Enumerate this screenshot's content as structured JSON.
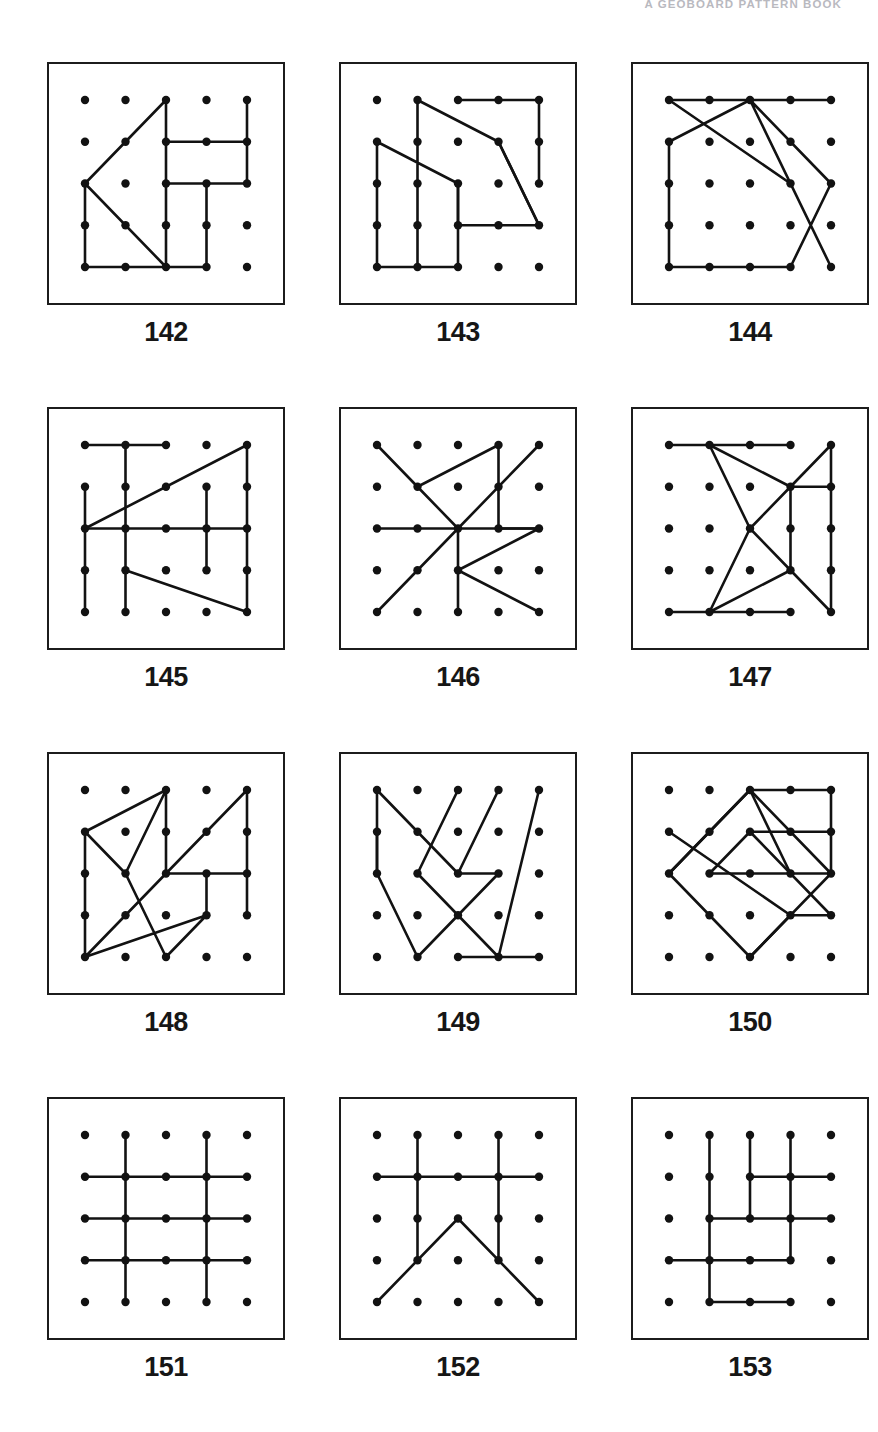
{
  "header": {
    "running_head": "A GEOBOARD PATTERN BOOK"
  },
  "geoboard": {
    "grid_size": 5,
    "dot_color": "#121212",
    "line_color": "#121212",
    "frame_color": "#1c1c1c",
    "background": "#ffffff"
  },
  "plates": [
    {
      "caption": "142",
      "paths": [
        [
          [
            2,
            0
          ],
          [
            0,
            2
          ],
          [
            2,
            4
          ],
          [
            2,
            0
          ]
        ],
        [
          [
            2,
            1
          ],
          [
            4,
            1
          ],
          [
            4,
            0
          ]
        ],
        [
          [
            2,
            2
          ],
          [
            4,
            2
          ],
          [
            4,
            1
          ]
        ],
        [
          [
            0,
            2
          ],
          [
            0,
            4
          ],
          [
            3,
            4
          ],
          [
            3,
            2
          ]
        ]
      ]
    },
    {
      "caption": "143",
      "paths": [
        [
          [
            1,
            0
          ],
          [
            1,
            4
          ],
          [
            2,
            4
          ],
          [
            2,
            2
          ],
          [
            0,
            1
          ],
          [
            0,
            4
          ],
          [
            1,
            4
          ]
        ],
        [
          [
            1,
            0
          ],
          [
            3,
            1
          ],
          [
            4,
            3
          ],
          [
            2,
            3
          ],
          [
            2,
            2
          ]
        ],
        [
          [
            2,
            0
          ],
          [
            4,
            0
          ],
          [
            4,
            2
          ]
        ],
        [
          [
            3,
            1
          ],
          [
            4,
            3
          ]
        ]
      ]
    },
    {
      "caption": "144",
      "paths": [
        [
          [
            0,
            0
          ],
          [
            4,
            0
          ]
        ],
        [
          [
            0,
            0
          ],
          [
            3,
            2
          ],
          [
            4,
            4
          ],
          [
            2,
            0
          ],
          [
            0,
            1
          ],
          [
            0,
            4
          ],
          [
            3,
            4
          ],
          [
            4,
            2
          ],
          [
            2,
            0
          ]
        ]
      ]
    },
    {
      "caption": "145",
      "paths": [
        [
          [
            0,
            0
          ],
          [
            2,
            0
          ]
        ],
        [
          [
            1,
            0
          ],
          [
            1,
            4
          ]
        ],
        [
          [
            0,
            1
          ],
          [
            0,
            4
          ]
        ],
        [
          [
            4,
            0
          ],
          [
            4,
            4
          ]
        ],
        [
          [
            3,
            1
          ],
          [
            3,
            3
          ]
        ],
        [
          [
            0,
            2
          ],
          [
            4,
            2
          ]
        ],
        [
          [
            4,
            0
          ],
          [
            0,
            2
          ]
        ],
        [
          [
            1,
            3
          ],
          [
            4,
            4
          ]
        ]
      ]
    },
    {
      "caption": "146",
      "paths": [
        [
          [
            0,
            0
          ],
          [
            1,
            1
          ],
          [
            3,
            0
          ],
          [
            3,
            2
          ],
          [
            4,
            2
          ]
        ],
        [
          [
            4,
            0
          ],
          [
            2,
            2
          ],
          [
            0,
            4
          ]
        ],
        [
          [
            1,
            1
          ],
          [
            2,
            2
          ],
          [
            4,
            2
          ],
          [
            2,
            3
          ],
          [
            4,
            4
          ]
        ],
        [
          [
            0,
            2
          ],
          [
            2,
            2
          ]
        ],
        [
          [
            2,
            2
          ],
          [
            2,
            4
          ]
        ]
      ]
    },
    {
      "caption": "147",
      "paths": [
        [
          [
            0,
            0
          ],
          [
            3,
            0
          ]
        ],
        [
          [
            1,
            0
          ],
          [
            3,
            1
          ],
          [
            4,
            0
          ],
          [
            4,
            4
          ],
          [
            3,
            3
          ],
          [
            1,
            4
          ],
          [
            0,
            4
          ],
          [
            3,
            4
          ]
        ],
        [
          [
            1,
            0
          ],
          [
            2,
            2
          ],
          [
            3,
            1
          ],
          [
            4,
            1
          ]
        ],
        [
          [
            2,
            2
          ],
          [
            3,
            3
          ]
        ],
        [
          [
            3,
            1
          ],
          [
            3,
            3
          ]
        ],
        [
          [
            1,
            4
          ],
          [
            2,
            2
          ]
        ]
      ]
    },
    {
      "caption": "148",
      "paths": [
        [
          [
            2,
            0
          ],
          [
            0,
            1
          ],
          [
            1,
            2
          ],
          [
            2,
            0
          ],
          [
            2,
            2
          ],
          [
            0,
            4
          ],
          [
            3,
            3
          ],
          [
            2,
            4
          ],
          [
            1,
            2
          ]
        ],
        [
          [
            2,
            2
          ],
          [
            4,
            0
          ],
          [
            4,
            2
          ],
          [
            2,
            2
          ]
        ],
        [
          [
            0,
            1
          ],
          [
            0,
            4
          ]
        ],
        [
          [
            3,
            2
          ],
          [
            3,
            3
          ]
        ],
        [
          [
            4,
            2
          ],
          [
            4,
            3
          ]
        ]
      ]
    },
    {
      "caption": "149",
      "paths": [
        [
          [
            0,
            0
          ],
          [
            2,
            2
          ],
          [
            3,
            0
          ]
        ],
        [
          [
            0,
            0
          ],
          [
            0,
            2
          ],
          [
            1,
            4
          ],
          [
            3,
            2
          ],
          [
            2,
            2
          ]
        ],
        [
          [
            0,
            1
          ],
          [
            0,
            2
          ]
        ],
        [
          [
            2,
            0
          ],
          [
            1,
            2
          ]
        ],
        [
          [
            1,
            2
          ],
          [
            3,
            4
          ]
        ],
        [
          [
            4,
            0
          ],
          [
            3,
            4
          ]
        ],
        [
          [
            2,
            4
          ],
          [
            4,
            4
          ]
        ]
      ]
    },
    {
      "caption": "150",
      "paths": [
        [
          [
            2,
            0
          ],
          [
            4,
            2
          ],
          [
            2,
            4
          ],
          [
            0,
            2
          ],
          [
            2,
            0
          ]
        ],
        [
          [
            0,
            1
          ],
          [
            3,
            3
          ],
          [
            4,
            3
          ],
          [
            2,
            1
          ],
          [
            1,
            2
          ]
        ],
        [
          [
            1,
            2
          ],
          [
            3,
            2
          ],
          [
            4,
            2
          ]
        ],
        [
          [
            2,
            0
          ],
          [
            3,
            2
          ]
        ],
        [
          [
            2,
            0
          ],
          [
            0,
            2
          ]
        ],
        [
          [
            2,
            1
          ],
          [
            4,
            1
          ],
          [
            4,
            0
          ],
          [
            2,
            0
          ]
        ],
        [
          [
            4,
            1
          ],
          [
            4,
            2
          ]
        ],
        [
          [
            3,
            3
          ],
          [
            2,
            4
          ]
        ]
      ]
    },
    {
      "caption": "151",
      "paths": [
        [
          [
            1,
            0
          ],
          [
            1,
            4
          ]
        ],
        [
          [
            3,
            0
          ],
          [
            3,
            4
          ]
        ],
        [
          [
            0,
            1
          ],
          [
            4,
            1
          ]
        ],
        [
          [
            0,
            2
          ],
          [
            4,
            2
          ]
        ],
        [
          [
            0,
            3
          ],
          [
            4,
            3
          ]
        ]
      ]
    },
    {
      "caption": "152",
      "paths": [
        [
          [
            1,
            0
          ],
          [
            1,
            3
          ]
        ],
        [
          [
            3,
            0
          ],
          [
            3,
            3
          ]
        ],
        [
          [
            0,
            1
          ],
          [
            4,
            1
          ]
        ],
        [
          [
            0,
            4
          ],
          [
            2,
            2
          ],
          [
            4,
            4
          ]
        ]
      ]
    },
    {
      "caption": "153",
      "paths": [
        [
          [
            1,
            0
          ],
          [
            1,
            4
          ]
        ],
        [
          [
            2,
            0
          ],
          [
            2,
            2
          ]
        ],
        [
          [
            3,
            0
          ],
          [
            3,
            2
          ]
        ],
        [
          [
            2,
            1
          ],
          [
            4,
            1
          ]
        ],
        [
          [
            1,
            2
          ],
          [
            4,
            2
          ]
        ],
        [
          [
            3,
            2
          ],
          [
            3,
            3
          ]
        ],
        [
          [
            0,
            3
          ],
          [
            3,
            3
          ]
        ],
        [
          [
            1,
            4
          ],
          [
            3,
            4
          ]
        ]
      ]
    }
  ]
}
